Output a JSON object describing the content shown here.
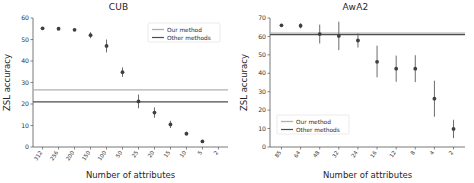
{
  "figure": {
    "width": 474,
    "height": 183,
    "background": "#ffffff"
  },
  "colors": {
    "our_method_line": "#b0b0b0",
    "other_methods_line": "#4d4d4d",
    "marker": "#3f3f3f",
    "errorbar": "#5b5b5b",
    "axis": "#555555",
    "text": "#262626"
  },
  "chart_data": [
    {
      "type": "scatter",
      "title": "CUB",
      "xlabel": "Number of attributes",
      "ylabel": "ZSL accuracy",
      "ylim": [
        0,
        60
      ],
      "yticks": [
        0,
        10,
        20,
        30,
        40,
        50,
        60
      ],
      "grid": false,
      "legend_position": "upper right",
      "legend": [
        "Our method",
        "Other methods"
      ],
      "categories": [
        "312",
        "256",
        "200",
        "150",
        "100",
        "50",
        "25",
        "20",
        "15",
        "10",
        "5",
        "2"
      ],
      "values": [
        55.2,
        55.0,
        54.5,
        52.0,
        47.0,
        34.8,
        21.2,
        16.0,
        10.5,
        6.2,
        2.6
      ],
      "series": [
        {
          "name": "Our method (per-attribute-count accuracy)",
          "x_labels": [
            "312",
            "256",
            "200",
            "150",
            "100",
            "50",
            "25",
            "20",
            "15",
            "10",
            "5"
          ],
          "values": [
            55.2,
            55.0,
            54.5,
            52.0,
            47.0,
            34.8,
            21.2,
            16.0,
            10.5,
            6.2,
            2.6
          ],
          "err_low": [
            54.6,
            54.5,
            54.0,
            50.6,
            44.0,
            32.6,
            18.0,
            13.6,
            8.8,
            5.3,
            2.1
          ],
          "err_high": [
            55.8,
            55.5,
            55.0,
            53.4,
            50.0,
            37.0,
            24.4,
            18.4,
            12.2,
            7.1,
            3.1
          ]
        }
      ],
      "reference_lines": [
        {
          "label": "Our method",
          "value": 26.6,
          "color": "#b0b0b0"
        },
        {
          "label": "Other methods",
          "value": 21.0,
          "color": "#4d4d4d"
        }
      ]
    },
    {
      "type": "scatter",
      "title": "AwA2",
      "xlabel": "Number of attributes",
      "ylabel": "ZSL accuracy",
      "ylim": [
        0,
        70
      ],
      "yticks": [
        0,
        10,
        20,
        30,
        40,
        50,
        60,
        70
      ],
      "grid": false,
      "legend_position": "lower left",
      "legend": [
        "Our method",
        "Other methods"
      ],
      "categories": [
        "85",
        "64",
        "48",
        "32",
        "24",
        "16",
        "12",
        "8",
        "4",
        "2"
      ],
      "values": [
        66.0,
        65.8,
        61.3,
        60.3,
        57.8,
        46.2,
        42.5,
        42.5,
        26.2,
        9.8
      ],
      "series": [
        {
          "name": "Our method (per-attribute-count accuracy)",
          "x_labels": [
            "85",
            "64",
            "48",
            "32",
            "24",
            "16",
            "12",
            "8",
            "4",
            "2"
          ],
          "values": [
            66.0,
            65.8,
            61.3,
            60.3,
            57.8,
            46.2,
            42.5,
            42.5,
            26.2,
            9.8
          ],
          "err_low": [
            65.2,
            64.4,
            56.2,
            52.6,
            54.0,
            37.8,
            35.4,
            35.2,
            16.4,
            4.8
          ],
          "err_high": [
            66.8,
            67.2,
            66.4,
            68.0,
            61.6,
            55.0,
            49.6,
            49.8,
            36.0,
            14.8
          ]
        }
      ],
      "reference_lines": [
        {
          "label": "Our method",
          "value": 61.8,
          "color": "#b0b0b0"
        },
        {
          "label": "Other methods",
          "value": 61.0,
          "color": "#4d4d4d"
        }
      ]
    }
  ]
}
